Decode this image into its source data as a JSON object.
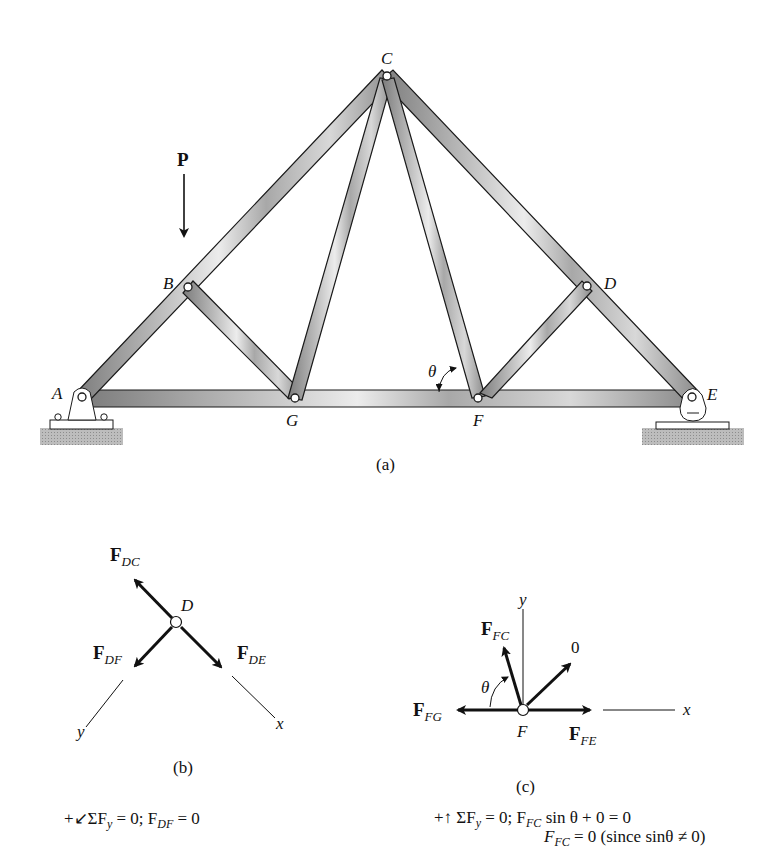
{
  "figure": {
    "part_a": {
      "caption": "(a)",
      "load_label": "P",
      "angle_label": "θ",
      "nodes": {
        "A": {
          "label": "A",
          "x": 82,
          "y": 397
        },
        "B": {
          "label": "B",
          "x": 188,
          "y": 287
        },
        "C": {
          "label": "C",
          "x": 387,
          "y": 76
        },
        "D": {
          "label": "D",
          "x": 587,
          "y": 286
        },
        "E": {
          "label": "E",
          "x": 692,
          "y": 397
        },
        "F": {
          "label": "F",
          "x": 478,
          "y": 398
        },
        "G": {
          "label": "G",
          "x": 295,
          "y": 398
        }
      },
      "members": [
        [
          "A",
          "B"
        ],
        [
          "B",
          "C"
        ],
        [
          "C",
          "D"
        ],
        [
          "D",
          "E"
        ],
        [
          "A",
          "G"
        ],
        [
          "G",
          "F"
        ],
        [
          "F",
          "E"
        ],
        [
          "B",
          "G"
        ],
        [
          "G",
          "C"
        ],
        [
          "C",
          "F"
        ],
        [
          "F",
          "D"
        ]
      ],
      "supports": {
        "A": "pin",
        "E": "roller"
      }
    },
    "part_b": {
      "caption": "(b)",
      "joint_label": "D",
      "forces": [
        {
          "name": "F",
          "sub": "DC"
        },
        {
          "name": "F",
          "sub": "DF"
        },
        {
          "name": "F",
          "sub": "DE"
        }
      ],
      "axes": {
        "x": "x",
        "y": "y"
      },
      "equation": {
        "prefix": "+↙ΣF",
        "prefix_sub": "y",
        "middle": " = 0; F",
        "middle_sub": "DF",
        "suffix": " = 0"
      }
    },
    "part_c": {
      "caption": "(c)",
      "joint_label": "F",
      "angle_label": "θ",
      "zero_label": "0",
      "forces": [
        {
          "name": "F",
          "sub": "FC"
        },
        {
          "name": "F",
          "sub": "FG"
        },
        {
          "name": "F",
          "sub": "FE"
        }
      ],
      "axes": {
        "x": "x",
        "y": "y"
      },
      "equation_line1": {
        "prefix": "+↑ ΣF",
        "prefix_sub": "y",
        "middle": " = 0; F",
        "middle_sub": "FC",
        "suffix": " sin θ + 0 = 0"
      },
      "equation_line2": {
        "prefix": "F",
        "prefix_sub": "FC",
        "suffix": " = 0 (since sinθ ≠ 0)"
      }
    }
  },
  "colors": {
    "member_fill": "#9a9a9a",
    "member_highlight": "#e6e6e6",
    "member_edge": "#1a1a1a",
    "ground": "#b5b5b5",
    "ink": "#111111"
  }
}
